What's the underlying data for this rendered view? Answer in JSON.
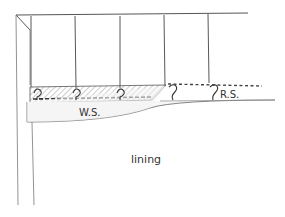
{
  "diagram": {
    "labels": {
      "wrong_side": "W.S.",
      "right_side": "R.S.",
      "lining": "lining"
    },
    "colors": {
      "ink": "#444444",
      "hatch": "#8a8a8a",
      "background": "#ffffff"
    },
    "hooks_count": 5,
    "strings_count": 5
  }
}
